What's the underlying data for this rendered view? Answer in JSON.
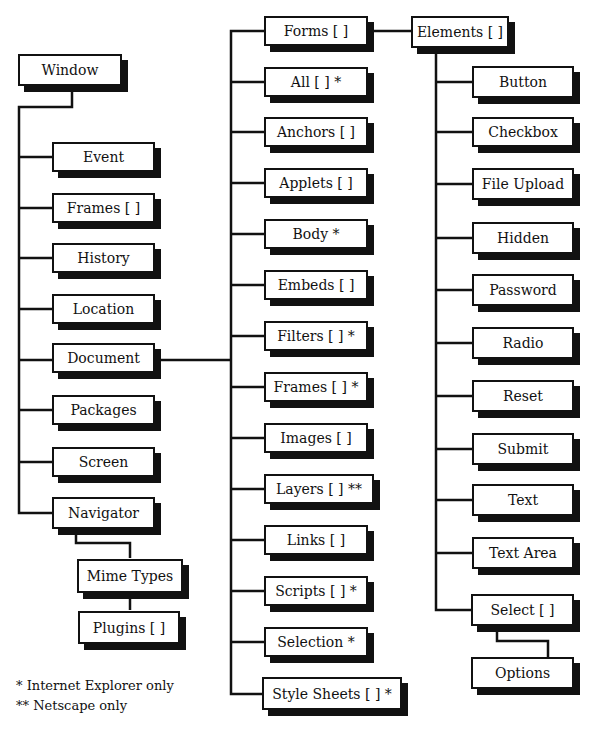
{
  "diagram": {
    "root": {
      "label": "Window"
    },
    "window_children": [
      {
        "label": "Event"
      },
      {
        "label": "Frames [ ]"
      },
      {
        "label": "History"
      },
      {
        "label": "Location"
      },
      {
        "label": "Document"
      },
      {
        "label": "Packages"
      },
      {
        "label": "Screen"
      },
      {
        "label": "Navigator"
      }
    ],
    "navigator_children": [
      {
        "label": "Mime Types"
      },
      {
        "label": "Plugins [ ]"
      }
    ],
    "document_children": [
      {
        "label": "Forms [ ]"
      },
      {
        "label": "All [ ] *"
      },
      {
        "label": "Anchors [ ]"
      },
      {
        "label": "Applets [ ]"
      },
      {
        "label": "Body *"
      },
      {
        "label": "Embeds [ ]"
      },
      {
        "label": "Filters [ ] *"
      },
      {
        "label": "Frames [ ] *"
      },
      {
        "label": "Images [ ]"
      },
      {
        "label": "Layers [ ] **"
      },
      {
        "label": "Links [ ]"
      },
      {
        "label": "Scripts [ ] *"
      },
      {
        "label": "Selection *"
      },
      {
        "label": "Style Sheets [ ] *"
      }
    ],
    "forms_child": {
      "label": "Elements [ ]"
    },
    "elements_children": [
      {
        "label": "Button"
      },
      {
        "label": "Checkbox"
      },
      {
        "label": "File Upload"
      },
      {
        "label": "Hidden"
      },
      {
        "label": "Password"
      },
      {
        "label": "Radio"
      },
      {
        "label": "Reset"
      },
      {
        "label": "Submit"
      },
      {
        "label": "Text"
      },
      {
        "label": "Text Area"
      },
      {
        "label": "Select [ ]"
      }
    ],
    "select_child": {
      "label": "Options"
    }
  },
  "legend": {
    "single_star": "* Internet Explorer only",
    "double_star": "** Netscape only"
  },
  "colors": {
    "line": "#111111",
    "box_fill": "#ffffff",
    "shadow": "#111111"
  }
}
